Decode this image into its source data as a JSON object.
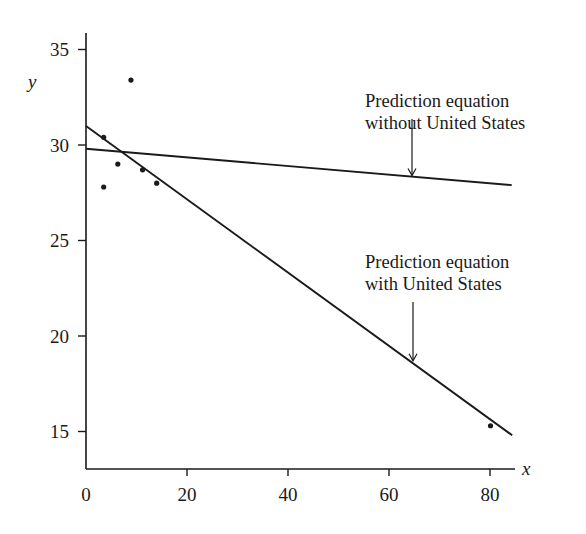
{
  "chart_data": {
    "type": "scatter",
    "title": "",
    "xlabel": "x",
    "ylabel": "y",
    "xlim": [
      0,
      85
    ],
    "ylim": [
      13,
      36
    ],
    "grid": false,
    "xticks": [
      0,
      20,
      40,
      60,
      80
    ],
    "yticks": [
      15,
      20,
      25,
      30,
      35
    ],
    "xtick_labels": [
      "0",
      "20",
      "40",
      "60",
      "80"
    ],
    "ytick_labels": [
      "15",
      "20",
      "25",
      "30",
      "35"
    ],
    "points": [
      {
        "x": 3.5,
        "y": 30.4
      },
      {
        "x": 3.5,
        "y": 27.8
      },
      {
        "x": 6.3,
        "y": 29.0
      },
      {
        "x": 8.9,
        "y": 33.4
      },
      {
        "x": 11.2,
        "y": 28.7
      },
      {
        "x": 14.0,
        "y": 28.0
      },
      {
        "x": 80.1,
        "y": 15.3
      }
    ],
    "series": [
      {
        "name": "Prediction equation with United States",
        "type": "line",
        "x": [
          0,
          84.4
        ],
        "y": [
          31.0,
          14.8
        ]
      },
      {
        "name": "Prediction equation without United States",
        "type": "line",
        "x": [
          0,
          84.3
        ],
        "y": [
          29.8,
          27.9
        ]
      }
    ],
    "annotations": [
      {
        "lines": [
          "Prediction equation",
          "without United States"
        ],
        "arrow_to": {
          "x": 64.9,
          "y": 28.3
        }
      },
      {
        "lines": [
          "Prediction equation",
          "with United States"
        ],
        "arrow_to": {
          "x": 64.7,
          "y": 18.6
        }
      }
    ]
  },
  "colors": {
    "ink": "#1a1a1a",
    "background": "#ffffff"
  }
}
